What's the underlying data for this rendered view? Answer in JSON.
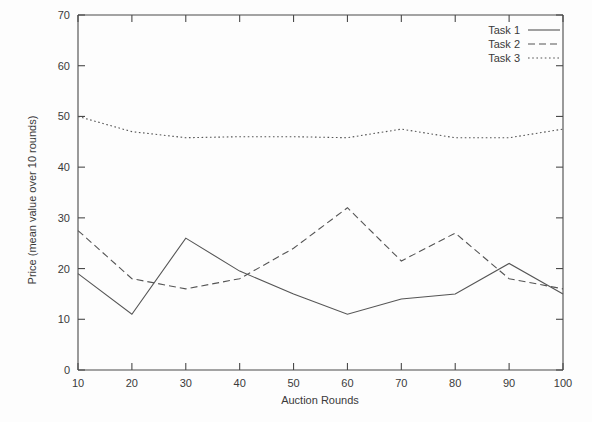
{
  "chart_data": {
    "type": "line",
    "title": "",
    "xlabel": "Auction Rounds",
    "ylabel": "Price (mean value over 10 rounds)",
    "x": [
      10,
      20,
      30,
      40,
      50,
      60,
      70,
      80,
      90,
      100
    ],
    "xlim": [
      10,
      100
    ],
    "ylim": [
      0,
      70
    ],
    "xticks": [
      "10",
      "20",
      "30",
      "40",
      "50",
      "60",
      "70",
      "80",
      "90",
      "100"
    ],
    "yticks": [
      "0",
      "10",
      "20",
      "30",
      "40",
      "50",
      "60",
      "70"
    ],
    "grid": false,
    "legend_position": "top-right",
    "series": [
      {
        "name": "Task 1",
        "style": "solid",
        "values": [
          19,
          11,
          26,
          19.5,
          15,
          11,
          14,
          15,
          21,
          15
        ]
      },
      {
        "name": "Task 2",
        "style": "dashed",
        "values": [
          27.5,
          18,
          16,
          18,
          24,
          32,
          21.5,
          27,
          18,
          16
        ]
      },
      {
        "name": "Task 3",
        "style": "dotted",
        "values": [
          50,
          47,
          45.8,
          46,
          46,
          45.8,
          47.5,
          45.8,
          45.8,
          47.5
        ]
      }
    ]
  },
  "axes": {
    "x_axis_name": "Auction Rounds",
    "y_axis_name": "Price (mean value over 10 rounds)"
  },
  "legend": {
    "entries": [
      {
        "label": "Task 1"
      },
      {
        "label": "Task 2"
      },
      {
        "label": "Task 3"
      }
    ]
  }
}
